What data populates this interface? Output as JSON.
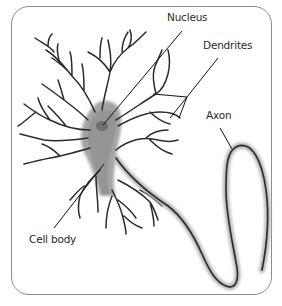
{
  "diagram": {
    "labels": {
      "nucleus": "Nucleus",
      "dendrites": "Dendrites",
      "axon": "Axon",
      "cell_body": "Cell body"
    },
    "colors": {
      "frame": "#8c8c8c",
      "cell_fill": "#9a9a9a",
      "nucleus_fill": "#6e6e6e",
      "outline": "#2b2b2b",
      "leader_line": "#111111",
      "label_text": "#2a2a2a"
    }
  }
}
